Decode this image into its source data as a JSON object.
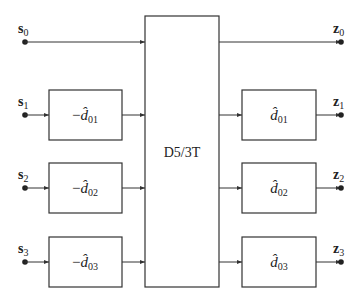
{
  "diagram": {
    "center_block": {
      "label": "D5/3T"
    },
    "inputs": [
      {
        "name": "s",
        "sub": "0"
      },
      {
        "name": "s",
        "sub": "1"
      },
      {
        "name": "s",
        "sub": "2"
      },
      {
        "name": "s",
        "sub": "3"
      }
    ],
    "outputs": [
      {
        "name": "z",
        "sub": "0"
      },
      {
        "name": "z",
        "sub": "1"
      },
      {
        "name": "z",
        "sub": "2"
      },
      {
        "name": "z",
        "sub": "3"
      }
    ],
    "pre_blocks": [
      {
        "sign": "−",
        "symbol": "d̂",
        "sub": "01"
      },
      {
        "sign": "−",
        "symbol": "d̂",
        "sub": "02"
      },
      {
        "sign": "−",
        "symbol": "d̂",
        "sub": "03"
      }
    ],
    "post_blocks": [
      {
        "symbol": "d̂",
        "sub": "01"
      },
      {
        "symbol": "d̂",
        "sub": "02"
      },
      {
        "symbol": "d̂",
        "sub": "03"
      }
    ]
  }
}
